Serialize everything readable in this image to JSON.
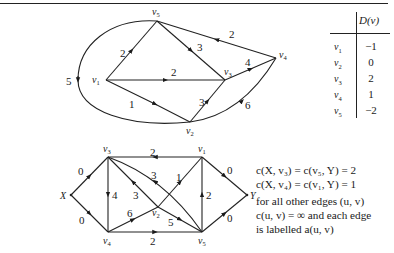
{
  "upper_graph": {
    "nodes": [
      {
        "id": "v1",
        "label": "v",
        "sub": "1",
        "x": 106,
        "y": 80
      },
      {
        "id": "v2",
        "label": "v",
        "sub": "2",
        "x": 190,
        "y": 122
      },
      {
        "id": "v3",
        "label": "v",
        "sub": "3",
        "x": 225,
        "y": 80
      },
      {
        "id": "v4",
        "label": "v",
        "sub": "4",
        "x": 276,
        "y": 58
      },
      {
        "id": "v5",
        "label": "v",
        "sub": "5",
        "x": 157,
        "y": 21
      }
    ],
    "edges": [
      {
        "from": "v1",
        "to": "v5",
        "weight": "2"
      },
      {
        "from": "v5",
        "to": "v3",
        "weight": "3"
      },
      {
        "from": "v4",
        "to": "v5",
        "weight": "2"
      },
      {
        "from": "v1",
        "to": "v3",
        "weight": "2"
      },
      {
        "from": "v3",
        "to": "v4",
        "weight": "4"
      },
      {
        "from": "v1",
        "to": "v2",
        "weight": "1"
      },
      {
        "from": "v2",
        "to": "v3",
        "weight": "3"
      },
      {
        "from": "v2",
        "to": "v4",
        "weight": "6"
      },
      {
        "from": "v5",
        "to": "v2",
        "weight": "5",
        "note": "curved loop around left"
      }
    ]
  },
  "demand_table": {
    "header": "D(v)",
    "rows": [
      {
        "vertex": "v",
        "sub": "1",
        "value": "−1"
      },
      {
        "vertex": "v",
        "sub": "2",
        "value": "0"
      },
      {
        "vertex": "v",
        "sub": "3",
        "value": "2"
      },
      {
        "vertex": "v",
        "sub": "4",
        "value": "1"
      },
      {
        "vertex": "v",
        "sub": "5",
        "value": "−2"
      }
    ]
  },
  "lower_graph": {
    "nodes": [
      {
        "id": "X",
        "label": "X",
        "x": 71,
        "y": 195
      },
      {
        "id": "Y",
        "label": "Y",
        "x": 247,
        "y": 195
      },
      {
        "id": "v1",
        "label": "v",
        "sub": "1",
        "x": 202,
        "y": 157
      },
      {
        "id": "v2",
        "label": "v",
        "sub": "2",
        "x": 158,
        "y": 207
      },
      {
        "id": "v3",
        "label": "v",
        "sub": "3",
        "x": 108,
        "y": 157
      },
      {
        "id": "v4",
        "label": "v",
        "sub": "4",
        "x": 108,
        "y": 232
      },
      {
        "id": "v5",
        "label": "v",
        "sub": "5",
        "x": 202,
        "y": 232
      }
    ],
    "edges": [
      {
        "from": "X",
        "to": "v3",
        "weight": "0"
      },
      {
        "from": "X",
        "to": "v4",
        "weight": "0"
      },
      {
        "from": "v1",
        "to": "v3",
        "weight": "2"
      },
      {
        "from": "v3",
        "to": "v4",
        "weight": "4"
      },
      {
        "from": "v5",
        "to": "v3",
        "weight": "3",
        "note": "curved"
      },
      {
        "from": "v2",
        "to": "v3",
        "weight": "3"
      },
      {
        "from": "v2",
        "to": "v1",
        "weight": "1"
      },
      {
        "from": "v4",
        "to": "v2",
        "weight": "6"
      },
      {
        "from": "v2",
        "to": "v5",
        "weight": "5"
      },
      {
        "from": "v4",
        "to": "v5",
        "weight": "2"
      },
      {
        "from": "v5",
        "to": "v1",
        "weight": "2"
      },
      {
        "from": "v1",
        "to": "Y",
        "weight": "0"
      },
      {
        "from": "v5",
        "to": "Y",
        "weight": "0"
      }
    ]
  },
  "notes": {
    "line1": "c(X, v₃) = c(v₅, Y) = 2",
    "line2": "c(X, v₄) = c(v₁, Y) = 1",
    "line3": "for all other edges (u, v)",
    "line4": "c(u, v) = ∞ and each edge",
    "line5": "is labelled a(u, v)"
  }
}
